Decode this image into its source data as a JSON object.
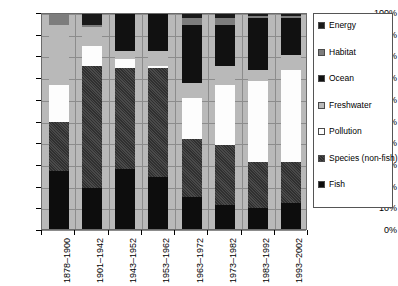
{
  "chart_data": {
    "type": "bar",
    "stacked": true,
    "normalized_percent": true,
    "title": "",
    "subtitle": "",
    "xlabel": "",
    "ylabel": "",
    "ylim": [
      0,
      100
    ],
    "grid": true,
    "legend_position": "right",
    "categories": [
      "1878–1900",
      "1901–1942",
      "1943–1952",
      "1953–1962",
      "1963–1972",
      "1973–1982",
      "1983–1992",
      "1993–2002"
    ],
    "y_ticks": [
      "0%",
      "10%",
      "20%",
      "30%",
      "40%",
      "50%",
      "60%",
      "70%",
      "80%",
      "90%",
      "100%"
    ],
    "y_tick_values": [
      0,
      10,
      20,
      30,
      40,
      50,
      60,
      70,
      80,
      90,
      100
    ],
    "stack_order_bottom_to_top": [
      "Fish",
      "Species (non-fish)",
      "Pollution",
      "Freshwater",
      "Ocean",
      "Habitat",
      "Energy"
    ],
    "series": [
      {
        "name": "Fish",
        "color": "#0d0d0d",
        "values": [
          27,
          19,
          28,
          24,
          15,
          11,
          10,
          12
        ]
      },
      {
        "name": "Species (non-fish)",
        "color": "#3a3a3a",
        "values": [
          23,
          57,
          47,
          51,
          27,
          28,
          21,
          19
        ]
      },
      {
        "name": "Pollution",
        "color": "#fdfdfd",
        "values": [
          17,
          9,
          4,
          1,
          19,
          28,
          38,
          43
        ]
      },
      {
        "name": "Freshwater",
        "color": "#b9b9b9",
        "values": [
          28,
          9,
          4,
          7,
          7,
          9,
          5,
          7
        ]
      },
      {
        "name": "Ocean",
        "color": "#111111",
        "values": [
          0,
          0,
          17,
          17,
          27,
          19,
          24,
          17
        ]
      },
      {
        "name": "Habitat",
        "color": "#7d7d7d",
        "values": [
          5,
          1,
          0,
          0,
          3,
          3,
          1,
          1
        ]
      },
      {
        "name": "Energy",
        "color": "#1a1a1a",
        "values": [
          0,
          5,
          0,
          0,
          2,
          2,
          1,
          1
        ]
      }
    ]
  },
  "legend": {
    "items": [
      {
        "label": "Energy",
        "swatch": "energy"
      },
      {
        "label": "Habitat",
        "swatch": "habitat"
      },
      {
        "label": "Ocean",
        "swatch": "ocean"
      },
      {
        "label": "Freshwater",
        "swatch": "fresh"
      },
      {
        "label": "Pollution",
        "swatch": "pollution"
      },
      {
        "label": "Species (non-fish)",
        "swatch": "species"
      },
      {
        "label": "Fish",
        "swatch": "fish"
      }
    ]
  }
}
